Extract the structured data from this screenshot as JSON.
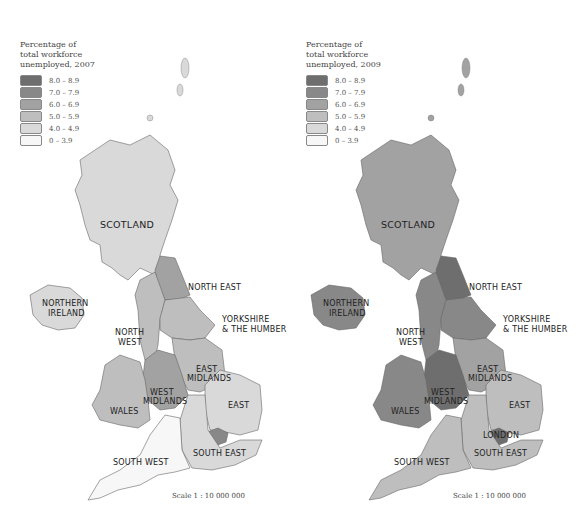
{
  "maps": [
    {
      "legend_title": "Percentage of\ntotal workforce\nunemployed, 2007",
      "scale": "Scale 1 : 10 000 000",
      "regions": {
        "scotland": {
          "label": "SCOTLAND",
          "band": 1
        },
        "northern_ireland": {
          "label1": "NORTHERN",
          "label2": "IRELAND",
          "band": 1
        },
        "north_east": {
          "label": "NORTH EAST",
          "band": 3
        },
        "north_west": {
          "label1": "NORTH",
          "label2": "WEST",
          "band": 2
        },
        "yorkshire": {
          "label1": "YORKSHIRE",
          "label2": "& THE HUMBER",
          "band": 2
        },
        "east_midlands": {
          "label1": "EAST",
          "label2": "MIDLANDS",
          "band": 2
        },
        "west_midlands": {
          "label1": "WEST",
          "label2": "MIDLANDS",
          "band": 3
        },
        "wales": {
          "label": "WALES",
          "band": 2
        },
        "east": {
          "label": "EAST",
          "band": 1
        },
        "london": {
          "label": "",
          "band": 4
        },
        "south_east": {
          "label": "SOUTH EAST",
          "band": 1
        },
        "south_west": {
          "label": "SOUTH WEST",
          "band": 0
        }
      }
    },
    {
      "legend_title": "Percentage of\ntotal workforce\nunemployed, 2009",
      "scale": "Scale 1 : 10 000 000",
      "regions": {
        "scotland": {
          "label": "SCOTLAND",
          "band": 3
        },
        "northern_ireland": {
          "label1": "NORTHERN",
          "label2": "IRELAND",
          "band": 4
        },
        "north_east": {
          "label": "NORTH EAST",
          "band": 5
        },
        "north_west": {
          "label1": "NORTH",
          "label2": "WEST",
          "band": 4
        },
        "yorkshire": {
          "label1": "YORKSHIRE",
          "label2": "& THE HUMBER",
          "band": 4
        },
        "east_midlands": {
          "label1": "EAST",
          "label2": "MIDLANDS",
          "band": 3
        },
        "west_midlands": {
          "label1": "WEST",
          "label2": "MIDLANDS",
          "band": 5
        },
        "wales": {
          "label": "WALES",
          "band": 4
        },
        "east": {
          "label": "EAST",
          "band": 2
        },
        "london": {
          "label": "LONDON",
          "band": 5
        },
        "south_east": {
          "label": "SOUTH EAST",
          "band": 2
        },
        "south_west": {
          "label": "SOUTH WEST",
          "band": 2
        }
      }
    }
  ],
  "legend_bands": [
    {
      "label": "8.0 – 8.9",
      "color": "#6e6e6e"
    },
    {
      "label": "7.0 – 7.9",
      "color": "#888888"
    },
    {
      "label": "6.0 – 6.9",
      "color": "#a2a2a2"
    },
    {
      "label": "5.0 – 5.9",
      "color": "#bebebe"
    },
    {
      "label": "4.0 – 4.9",
      "color": "#d9d9d9"
    },
    {
      "label": "0 – 3.9",
      "color": "#f7f7f7"
    }
  ],
  "band_colors": [
    "#f7f7f7",
    "#d9d9d9",
    "#bebebe",
    "#a2a2a2",
    "#888888",
    "#6e6e6e"
  ]
}
